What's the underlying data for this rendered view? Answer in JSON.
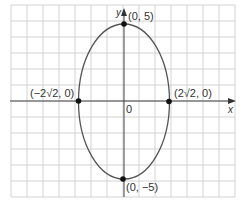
{
  "chart_data": {
    "type": "line",
    "title": "",
    "xlabel": "x",
    "ylabel": "y",
    "grid": true,
    "curve": "ellipse",
    "equation_implied": "x^2/8 + y^2/25 = 1",
    "center": [
      0,
      0
    ],
    "semi_axis_x": 2.828,
    "semi_axis_y": 5,
    "xlim": [
      -7.2,
      7.2
    ],
    "ylim": [
      -6,
      6.2
    ],
    "origin_label": "0",
    "points": [
      {
        "x": 0,
        "y": 5,
        "label": "(0, 5)"
      },
      {
        "x": 0,
        "y": -5,
        "label": "(0, −5)"
      },
      {
        "x": -2.828,
        "y": 0,
        "label": "(−2√2, 0)"
      },
      {
        "x": 2.828,
        "y": 0,
        "label": "(2√2, 0)"
      }
    ]
  },
  "labels": {
    "x_axis": "x",
    "y_axis": "y",
    "origin": "0",
    "top": "(0, 5)",
    "bottom": "(0, −5)",
    "left": "(−2√2, 0)",
    "right": "(2√2, 0)"
  },
  "colors": {
    "grid": "#c8c8c8",
    "axis": "#444444",
    "curve": "#555555",
    "point": "#111111"
  }
}
